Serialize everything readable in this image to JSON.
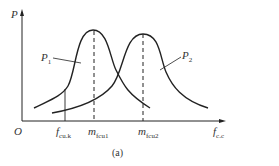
{
  "figure": {
    "caption": "(a)",
    "y_axis_label": "P",
    "origin_label": "O",
    "x_axis_label": {
      "main": "f",
      "sub": "c.c"
    },
    "curves": [
      {
        "name": "P",
        "sub": "1"
      },
      {
        "name": "P",
        "sub": "2"
      }
    ],
    "x_marks": [
      {
        "main": "f",
        "sub": "cu.k"
      },
      {
        "main": "m",
        "sub": "fcu1"
      },
      {
        "main": "m",
        "sub": "fcu2"
      }
    ],
    "colors": {
      "line": "#222222",
      "text": "#333333",
      "background": "#ffffff"
    }
  }
}
